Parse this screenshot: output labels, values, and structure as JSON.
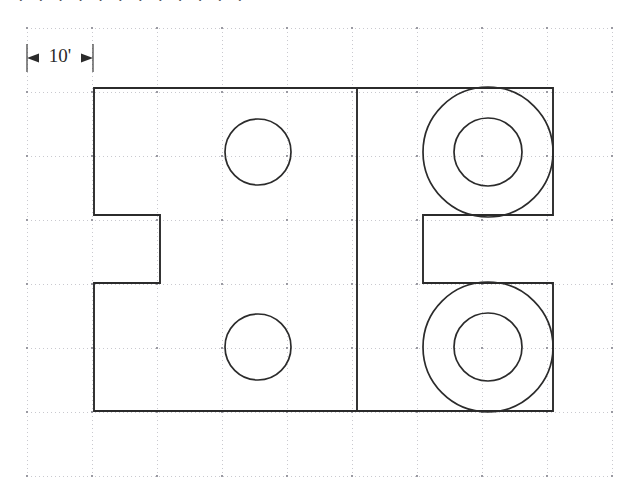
{
  "drawing": {
    "title": "engineering-plan-view",
    "dimension": {
      "label": "10'",
      "value": 10,
      "unit": "feet",
      "arrow_style": "outward",
      "extension_line_left_x": 27,
      "extension_line_right_x": 93
    },
    "colors": {
      "outline": "#2b2b2b",
      "grid": "#c9c9cf",
      "grid_node": "#9a9aa2",
      "background": "#ffffff",
      "dimension_text": "#2b2b2b"
    },
    "grid": {
      "origin_x": 27,
      "origin_y": 28,
      "spacing_x": 65,
      "spacing_y": 64,
      "columns": 10,
      "rows": 7,
      "style": "dotted",
      "x_positions": [
        27,
        92,
        157,
        222,
        287,
        352,
        417,
        482,
        547,
        612
      ],
      "y_positions": [
        28,
        92,
        156,
        220,
        284,
        348,
        412,
        476
      ]
    },
    "part_outline": {
      "description": "rectangular plate with two rectangular notches on left and right edges",
      "points": [
        [
          94,
          88
        ],
        [
          357,
          88
        ],
        [
          553,
          88
        ],
        [
          553,
          215
        ],
        [
          423,
          215
        ],
        [
          423,
          283
        ],
        [
          553,
          283
        ],
        [
          553,
          411
        ],
        [
          94,
          411
        ],
        [
          94,
          283
        ],
        [
          160,
          283
        ],
        [
          160,
          215
        ],
        [
          94,
          215
        ]
      ],
      "top_y": 88,
      "bottom_y": 411,
      "left_x": 94,
      "right_x": 553
    },
    "divider_line": {
      "label": "vertical-section-line",
      "x": 357,
      "y_start": 88,
      "y_end": 411
    },
    "holes": [
      {
        "label": "small-hole-top-left",
        "cx": 258,
        "cy": 152,
        "r": 33,
        "type": "simple"
      },
      {
        "label": "small-hole-bottom-left",
        "cx": 258,
        "cy": 347,
        "r": 33,
        "type": "simple"
      },
      {
        "label": "counterbore-top-right-outer",
        "cx": 488,
        "cy": 152,
        "r": 65,
        "type": "outer"
      },
      {
        "label": "counterbore-top-right-inner",
        "cx": 488,
        "cy": 152,
        "r": 34,
        "type": "inner"
      },
      {
        "label": "counterbore-bottom-right-outer",
        "cx": 488,
        "cy": 347,
        "r": 65,
        "type": "outer"
      },
      {
        "label": "counterbore-bottom-right-inner",
        "cx": 488,
        "cy": 347,
        "r": 34,
        "type": "inner"
      }
    ],
    "cropped_header_text": "· · · · · · · · · · · ·"
  }
}
